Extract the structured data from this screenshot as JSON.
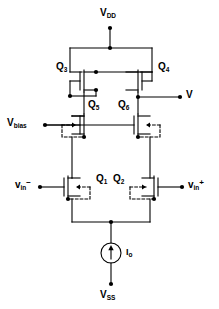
{
  "diagram": {
    "type": "schematic",
    "line_color": "#000000",
    "background": "#ffffff"
  },
  "rails": {
    "top": {
      "label_main": "V",
      "label_sub": "DD",
      "name": "vdd"
    },
    "bottom": {
      "label_main": "V",
      "label_sub": "SS",
      "name": "vss"
    }
  },
  "terminals": {
    "vbias": {
      "label_main": "V",
      "label_sub": "bias"
    },
    "vin_minus": {
      "label_main": "v",
      "label_sub": "in",
      "label_sup": "−"
    },
    "vin_plus": {
      "label_main": "v",
      "label_sub": "in",
      "label_sup": "+"
    },
    "vout": {
      "label_main": "V"
    }
  },
  "transistors": [
    {
      "id": "Q3",
      "label_main": "Q",
      "label_sub": "3",
      "type": "pmos"
    },
    {
      "id": "Q4",
      "label_main": "Q",
      "label_sub": "4",
      "type": "pmos"
    },
    {
      "id": "Q5",
      "label_main": "Q",
      "label_sub": "5",
      "type": "nmos"
    },
    {
      "id": "Q6",
      "label_main": "Q",
      "label_sub": "6",
      "type": "nmos"
    },
    {
      "id": "Q1",
      "label_main": "Q",
      "label_sub": "1",
      "type": "nmos"
    },
    {
      "id": "Q2",
      "label_main": "Q",
      "label_sub": "2",
      "type": "nmos"
    }
  ],
  "current_source": {
    "label_main": "I",
    "label_sub": "o",
    "direction": "up"
  }
}
